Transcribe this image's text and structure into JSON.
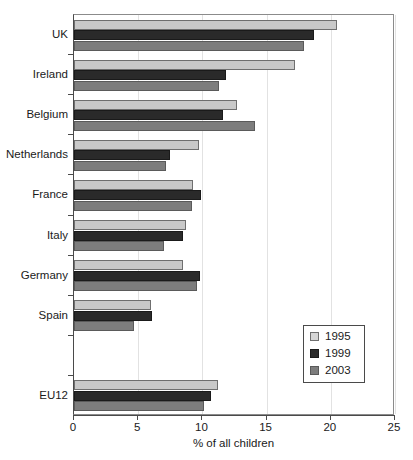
{
  "chart_data": {
    "type": "bar",
    "orientation": "horizontal",
    "title": "",
    "xlabel": "% of all children",
    "ylabel": "",
    "xlim": [
      0,
      25
    ],
    "xticks": [
      0,
      5,
      10,
      15,
      20,
      25
    ],
    "xtick_labels": [
      "0",
      "5",
      "10",
      "15",
      "20",
      "25"
    ],
    "grid": "vertical-light",
    "legend_position": "inner-right-lower",
    "categories": [
      "UK",
      "Ireland",
      "Belgium",
      "Netherlands",
      "France",
      "Italy",
      "Germany",
      "Spain",
      "",
      "EU12"
    ],
    "series": [
      {
        "name": "1995",
        "color": "#c9c9c9",
        "values": [
          20.5,
          17.2,
          12.7,
          9.7,
          9.3,
          8.7,
          8.5,
          6.0,
          null,
          11.2
        ]
      },
      {
        "name": "1999",
        "color": "#2a2a2a",
        "values": [
          18.7,
          11.8,
          11.6,
          7.5,
          9.9,
          8.5,
          9.8,
          6.1,
          null,
          10.7
        ]
      },
      {
        "name": "2003",
        "color": "#7d7d7d",
        "values": [
          17.9,
          11.3,
          14.1,
          7.2,
          9.2,
          7.0,
          9.6,
          4.7,
          null,
          10.1
        ]
      }
    ]
  },
  "legend": {
    "items": [
      {
        "label": "1995",
        "swatch": "s1995"
      },
      {
        "label": "1999",
        "swatch": "s1999"
      },
      {
        "label": "2003",
        "swatch": "s2003"
      }
    ]
  },
  "axis": {
    "x_title": "% of all children"
  }
}
